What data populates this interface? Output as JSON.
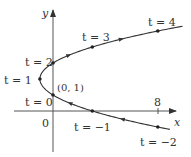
{
  "chart_data": {
    "type": "line",
    "title": "",
    "xlabel": "x",
    "ylabel": "y",
    "equation": "x = t^2 - 2t, y = t + 1",
    "x_ticks": [
      "8"
    ],
    "origin_label": "0",
    "series": [
      {
        "name": "parametric curve",
        "points": [
          {
            "t": -2,
            "x": 8,
            "y": -1,
            "label": "t = −2"
          },
          {
            "t": -1,
            "x": 3,
            "y": 0,
            "label": "t = −1"
          },
          {
            "t": 0,
            "x": 0,
            "y": 1,
            "label": "t = 0"
          },
          {
            "t": 1,
            "x": -1,
            "y": 2,
            "label": "t = 1"
          },
          {
            "t": 2,
            "x": 0,
            "y": 3,
            "label": "t = 2"
          },
          {
            "t": 3,
            "x": 3,
            "y": 4,
            "label": "t = 3"
          },
          {
            "t": 4,
            "x": 8,
            "y": 5,
            "label": "t = 4"
          }
        ]
      }
    ],
    "annotations": [
      "(0, 1)"
    ],
    "grid": false,
    "xlim": [
      -2,
      10
    ],
    "ylim": [
      -2,
      6
    ]
  },
  "labels": {
    "x_axis": "x",
    "y_axis": "y",
    "origin": "0",
    "tick_8": "8",
    "point_0_1": "(0, 1)",
    "t_4": "t = 4",
    "t_3": "t = 3",
    "t_2": "t = 2",
    "t_1": "t = 1",
    "t_0": "t = 0",
    "t_m1": "t = −1",
    "t_m2": "t = −2"
  },
  "colors": {
    "curve": "#333333",
    "axis": "#555555",
    "text": "#333333"
  }
}
